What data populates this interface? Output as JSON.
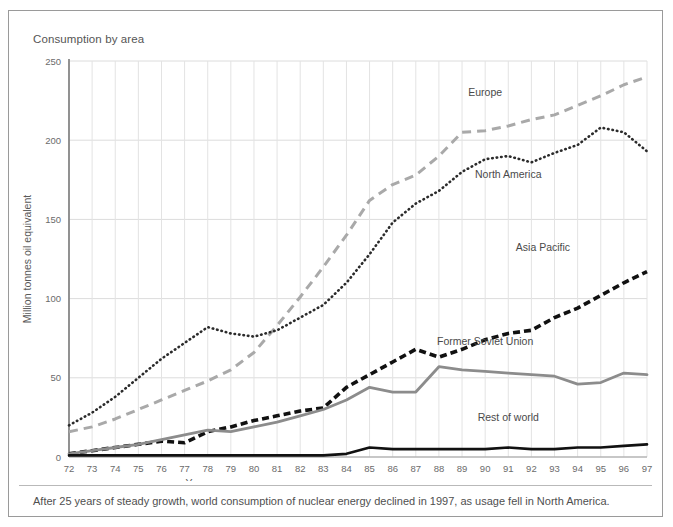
{
  "figure": {
    "title": "Consumption by area",
    "caption": "After 25 years of steady growth, world consumption of nuclear energy declined in 1997, as usage fell in North America."
  },
  "chart_data": {
    "type": "line",
    "title": "Consumption by area",
    "xlabel": "Year",
    "ylabel": "Million tonnes oil equivalent",
    "xlim": [
      72,
      97
    ],
    "ylim": [
      0,
      250
    ],
    "yticks": [
      0,
      50,
      100,
      150,
      200,
      250
    ],
    "xticks": [
      "72",
      "73",
      "74",
      "75",
      "76",
      "77",
      "78",
      "79",
      "80",
      "81",
      "82",
      "83",
      "84",
      "85",
      "86",
      "87",
      "88",
      "89",
      "90",
      "91",
      "92",
      "93",
      "94",
      "95",
      "96",
      "97"
    ],
    "grid": true,
    "legend_position": "inline-labels",
    "x": [
      1972,
      1973,
      1974,
      1975,
      1976,
      1977,
      1978,
      1979,
      1980,
      1981,
      1982,
      1983,
      1984,
      1985,
      1986,
      1987,
      1988,
      1989,
      1990,
      1991,
      1992,
      1993,
      1994,
      1995,
      1996,
      1997
    ],
    "series": [
      {
        "name": "Europe",
        "color": "#a9a9a9",
        "style": "dashed",
        "label_x": 90,
        "label_y": 228,
        "values": [
          16,
          19,
          24,
          30,
          36,
          42,
          48,
          55,
          66,
          83,
          101,
          120,
          140,
          162,
          172,
          178,
          190,
          205,
          206,
          209,
          213,
          216,
          222,
          228,
          235,
          240
        ]
      },
      {
        "name": "North America",
        "color": "#2b2b2b",
        "style": "dotted",
        "label_x": 91,
        "label_y": 176,
        "values": [
          20,
          28,
          38,
          50,
          62,
          72,
          82,
          78,
          76,
          80,
          88,
          96,
          110,
          128,
          148,
          160,
          168,
          180,
          188,
          190,
          186,
          192,
          197,
          208,
          205,
          193
        ]
      },
      {
        "name": "Asia Pacific",
        "color": "#111111",
        "style": "dashed-bold",
        "label_x": 92.5,
        "label_y": 130,
        "values": [
          2,
          4,
          6,
          8,
          10,
          9,
          16,
          19,
          23,
          26,
          29,
          31,
          44,
          52,
          60,
          68,
          63,
          68,
          74,
          78,
          80,
          88,
          94,
          102,
          110,
          117
        ]
      },
      {
        "name": "Former Soviet Union",
        "color": "#8c8c8c",
        "style": "solid",
        "label_x": 90,
        "label_y": 71,
        "values": [
          2,
          4,
          6,
          8,
          11,
          14,
          17,
          16,
          19,
          22,
          26,
          30,
          36,
          44,
          41,
          41,
          57,
          55,
          54,
          53,
          52,
          51,
          46,
          47,
          53,
          52
        ]
      },
      {
        "name": "Rest of world",
        "color": "#111111",
        "style": "solid-bold",
        "label_x": 91,
        "label_y": 23,
        "values": [
          1,
          1,
          1,
          1,
          1,
          1,
          1,
          1,
          1,
          1,
          1,
          1,
          2,
          6,
          5,
          5,
          5,
          5,
          5,
          6,
          5,
          5,
          6,
          6,
          7,
          8
        ]
      }
    ]
  }
}
